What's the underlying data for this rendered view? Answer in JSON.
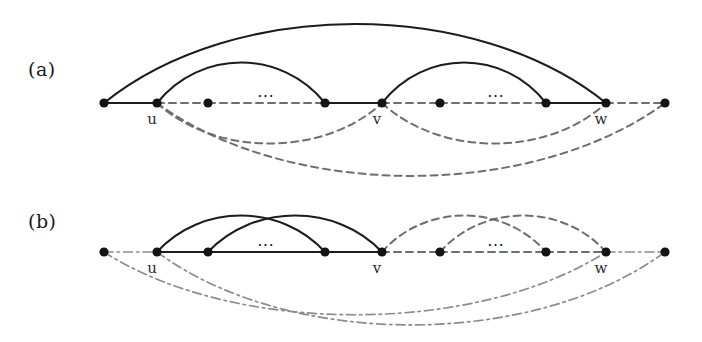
{
  "figure": {
    "width": 702,
    "height": 342,
    "background": "#ffffff",
    "ink_color": "#1c1c1c",
    "dashed_color": "#6e6e6e",
    "dashdot_color": "#8c8c8c",
    "node_color": "#141414"
  },
  "panels": [
    {
      "id": "a",
      "label": "(a)",
      "label_pos": {
        "x": 28,
        "y": 58
      },
      "baseline_y": 103,
      "nodes": [
        {
          "id": "n1",
          "x": 104,
          "label": ""
        },
        {
          "id": "u",
          "x": 157,
          "label": "u"
        },
        {
          "id": "n3",
          "x": 208,
          "label": ""
        },
        {
          "id": "n4",
          "x": 325,
          "label": ""
        },
        {
          "id": "v",
          "x": 382,
          "label": "v"
        },
        {
          "id": "n6",
          "x": 440,
          "label": ""
        },
        {
          "id": "n7",
          "x": 546,
          "label": ""
        },
        {
          "id": "w",
          "x": 606,
          "label": "w"
        },
        {
          "id": "n9",
          "x": 665,
          "label": ""
        }
      ],
      "ellipses": [
        {
          "x": 266,
          "y": 101,
          "text": "⋯"
        },
        {
          "x": 496,
          "y": 101,
          "text": "⋯"
        }
      ],
      "node_labels": [
        {
          "text": "u",
          "x": 152,
          "y": 112
        },
        {
          "text": "v",
          "x": 377,
          "y": 112
        },
        {
          "text": "w",
          "x": 601,
          "y": 112
        }
      ],
      "baseline_segments": [
        {
          "from": "n1",
          "to": "u",
          "style": "solid"
        },
        {
          "from": "u",
          "to": "n3",
          "style": "dashed"
        },
        {
          "from": "n3",
          "to": "n4",
          "style": "dashed"
        },
        {
          "from": "n4",
          "to": "v",
          "style": "solid"
        },
        {
          "from": "v",
          "to": "n6",
          "style": "dashed"
        },
        {
          "from": "n6",
          "to": "n7",
          "style": "dashed"
        },
        {
          "from": "n7",
          "to": "w",
          "style": "solid"
        },
        {
          "from": "w",
          "to": "n9",
          "style": "dashed"
        }
      ],
      "arcs_above": [
        {
          "from": "n1",
          "to": "w",
          "style": "solid",
          "rise": 78
        },
        {
          "from": "u",
          "to": "n4",
          "style": "solid",
          "rise": 40
        },
        {
          "from": "v",
          "to": "n7",
          "style": "solid",
          "rise": 40
        }
      ],
      "arcs_below": [
        {
          "from": "u",
          "to": "v",
          "style": "dashed",
          "drop": 40
        },
        {
          "from": "v",
          "to": "w",
          "style": "dashed",
          "drop": 40
        },
        {
          "from": "u",
          "to": "n9",
          "style": "dashed",
          "drop": 72
        }
      ]
    },
    {
      "id": "b",
      "label": "(b)",
      "label_pos": {
        "x": 28,
        "y": 210
      },
      "baseline_y": 252,
      "nodes": [
        {
          "id": "n1",
          "x": 104,
          "label": ""
        },
        {
          "id": "u",
          "x": 157,
          "label": "u"
        },
        {
          "id": "n3",
          "x": 208,
          "label": ""
        },
        {
          "id": "n4",
          "x": 325,
          "label": ""
        },
        {
          "id": "v",
          "x": 382,
          "label": "v"
        },
        {
          "id": "n6",
          "x": 440,
          "label": ""
        },
        {
          "id": "n7",
          "x": 546,
          "label": ""
        },
        {
          "id": "w",
          "x": 606,
          "label": "w"
        },
        {
          "id": "n9",
          "x": 665,
          "label": ""
        }
      ],
      "ellipses": [
        {
          "x": 266,
          "y": 250,
          "text": "⋯"
        },
        {
          "x": 496,
          "y": 250,
          "text": "⋯"
        }
      ],
      "node_labels": [
        {
          "text": "u",
          "x": 152,
          "y": 261
        },
        {
          "text": "v",
          "x": 377,
          "y": 261
        },
        {
          "text": "w",
          "x": 601,
          "y": 261
        }
      ],
      "baseline_segments": [
        {
          "from": "n1",
          "to": "u",
          "style": "dashdot"
        },
        {
          "from": "u",
          "to": "n3",
          "style": "solid"
        },
        {
          "from": "n3",
          "to": "n4",
          "style": "solid"
        },
        {
          "from": "n4",
          "to": "v",
          "style": "solid"
        },
        {
          "from": "v",
          "to": "n6",
          "style": "dashed"
        },
        {
          "from": "n6",
          "to": "n7",
          "style": "dashed"
        },
        {
          "from": "n7",
          "to": "w",
          "style": "dashed"
        },
        {
          "from": "w",
          "to": "n9",
          "style": "dashdot"
        }
      ],
      "arcs_above": [
        {
          "from": "u",
          "to": "n4",
          "style": "solid",
          "rise": 36
        },
        {
          "from": "n3",
          "to": "v",
          "style": "solid",
          "rise": 36
        },
        {
          "from": "v",
          "to": "n7",
          "style": "dashed",
          "rise": 36
        },
        {
          "from": "n6",
          "to": "w",
          "style": "dashed",
          "rise": 36
        }
      ],
      "arcs_below": [
        {
          "from": "n1",
          "to": "w",
          "style": "dashdot",
          "drop": 62
        },
        {
          "from": "u",
          "to": "n9",
          "style": "dashdot",
          "drop": 72
        }
      ]
    }
  ]
}
